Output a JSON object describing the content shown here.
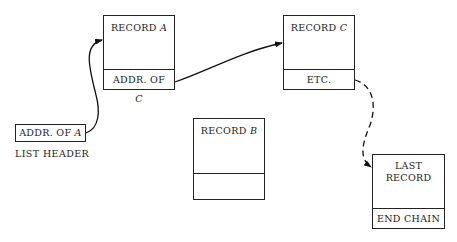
{
  "diagram": {
    "type": "linked-list-chain",
    "list_header": {
      "cell_text": "ADDR. OF",
      "cell_var": "A",
      "caption": "LIST HEADER"
    },
    "records": [
      {
        "id": "A",
        "title": "RECORD",
        "title_var": "A",
        "pointer_text": "ADDR. OF",
        "pointer_var": "C"
      },
      {
        "id": "C",
        "title": "RECORD",
        "title_var": "C",
        "pointer_text": "ETC.",
        "pointer_var": ""
      },
      {
        "id": "B",
        "title": "RECORD",
        "title_var": "B",
        "pointer_text": "",
        "pointer_var": ""
      },
      {
        "id": "LAST",
        "title_line1": "LAST",
        "title_line2": "RECORD",
        "pointer_text": "END CHAIN"
      }
    ],
    "edges": [
      {
        "from": "list_header",
        "to": "A",
        "style": "solid"
      },
      {
        "from": "A",
        "to": "C",
        "style": "solid"
      },
      {
        "from": "C",
        "to": "LAST",
        "style": "dashed"
      }
    ]
  }
}
